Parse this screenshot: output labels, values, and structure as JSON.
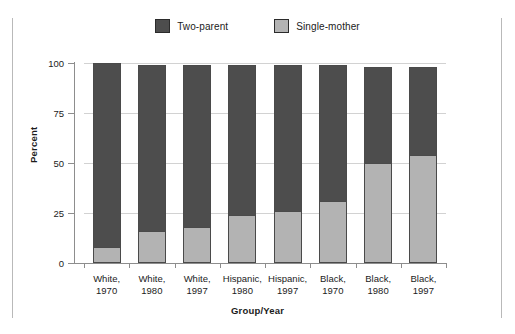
{
  "chart_data": {
    "type": "bar",
    "subtype": "stacked-bar-100",
    "title": "",
    "xlabel": "Group/Year",
    "ylabel": "Percent",
    "ylim": [
      0,
      100
    ],
    "yticks": [
      0,
      25,
      50,
      75,
      100
    ],
    "ytick_labels": [
      "0",
      "25",
      "50",
      "75",
      "100"
    ],
    "grid": true,
    "grid_axis": "y",
    "legend_position": "top-center",
    "categories": [
      "White, 1970",
      "White, 1980",
      "White, 1997",
      "Hispanic, 1980",
      "Hispanic, 1997",
      "Black, 1970",
      "Black, 1980",
      "Black, 1997"
    ],
    "category_lines": [
      [
        "White,",
        "1970"
      ],
      [
        "White,",
        "1980"
      ],
      [
        "White,",
        "1997"
      ],
      [
        "Hispanic,",
        "1980"
      ],
      [
        "Hispanic,",
        "1997"
      ],
      [
        "Black,",
        "1970"
      ],
      [
        "Black,",
        "1980"
      ],
      [
        "Black,",
        "1997"
      ]
    ],
    "series": [
      {
        "name": "Single-mother",
        "color": "#b3b3b3",
        "values": [
          8,
          16,
          18,
          24,
          26,
          31,
          50,
          54
        ]
      },
      {
        "name": "Two-parent",
        "color": "#4d4d4d",
        "values": [
          92,
          83,
          81,
          75,
          73,
          68,
          48,
          44
        ]
      }
    ],
    "series_totals": [
      100,
      99,
      99,
      99,
      99,
      99,
      98,
      98
    ]
  },
  "legend": {
    "items": [
      {
        "label": "Two-parent",
        "color": "#4d4d4d"
      },
      {
        "label": "Single-mother",
        "color": "#b3b3b3"
      }
    ]
  },
  "axes": {
    "y_title": "Percent",
    "x_title": "Group/Year"
  }
}
